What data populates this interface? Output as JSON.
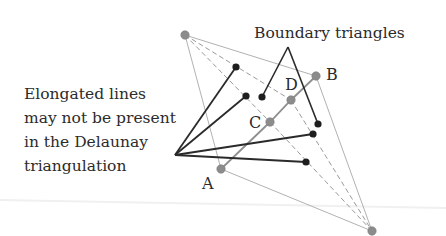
{
  "figure": {
    "title_label": "Boundary triangles",
    "caption_lines": [
      "Elongated lines",
      "may not be present",
      "in the Delaunay",
      "triangulation"
    ],
    "point_labels": {
      "A": "A",
      "B": "B",
      "C": "C",
      "D": "D"
    }
  },
  "colors": {
    "black_line": "#2a2a2a",
    "gray_point": "#8c8c8c",
    "gray_line": "#9a9a9a",
    "black_point": "#1e1e1e",
    "text": "#2b2b2b",
    "background": "#ffffff"
  },
  "geometry": {
    "gray_points": {
      "top": [
        185,
        35
      ],
      "B": [
        316,
        76
      ],
      "D": [
        291,
        100
      ],
      "C": [
        270,
        122
      ],
      "A": [
        221,
        169
      ],
      "bottom": [
        372,
        231
      ]
    },
    "fan_apex": [
      175,
      155
    ],
    "black_points": [
      [
        236,
        67
      ],
      [
        246,
        96
      ],
      [
        262,
        97
      ],
      [
        318,
        124
      ],
      [
        313,
        134
      ],
      [
        306,
        162
      ]
    ],
    "boundary_apex": [
      288,
      47
    ]
  }
}
